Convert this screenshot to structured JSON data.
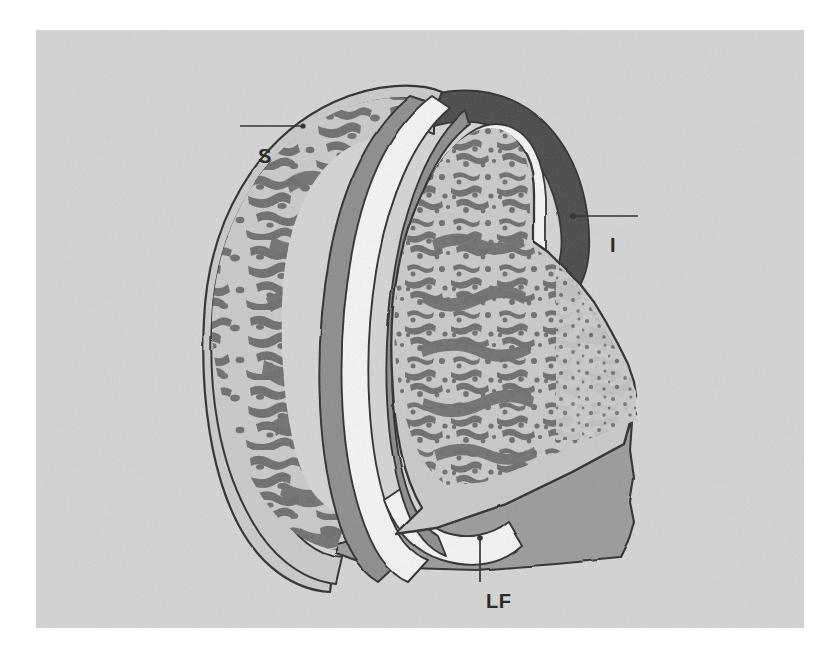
{
  "figure": {
    "kind": "anatomical-illustration",
    "view": "sagittal cut-away, cancellous bone shown in stipple",
    "background_color": "#d4d4d4",
    "page_color": "#ffffff"
  },
  "labels": {
    "superior": {
      "text": "S",
      "meaning": "superior articular process",
      "leader": "horizontal line pointing right to cortical margin"
    },
    "inferior": {
      "text": "I",
      "meaning": "inferior articular process",
      "leader": "horizontal line pointing left to bone margin"
    },
    "ligamentum_flavum": {
      "text": "LF",
      "meaning": "ligamentum flavum",
      "leader": "vertical line pointing up to lower contour"
    }
  },
  "palette": {
    "panel_background": "#d4d4d4",
    "cancellous_matrix": "#c9c9c9",
    "trabeculae": "#6d6d6d",
    "cortical_outline": "#2e2e2e",
    "articular_cartilage": "#8c8c8c",
    "joint_cavity": "#f4f4f2",
    "dark_capsule": "#4a4a4a",
    "ligamentum_flavum_fill": "#9a9a9a",
    "label_text": "#2b2b2b"
  },
  "structures": [
    {
      "name": "superior-articular-process",
      "fill": "#c9c9c9",
      "note": "crescent of cancellous bone on the left"
    },
    {
      "name": "articular-cartilage-superior",
      "fill": "#8c8c8c",
      "note": "grey band facing the joint"
    },
    {
      "name": "joint-cavity",
      "fill": "#f4f4f2",
      "note": "white cleft between cartilage surfaces"
    },
    {
      "name": "articular-cartilage-inferior",
      "fill": "#8c8c8c",
      "note": "grey band on the inferior process"
    },
    {
      "name": "inferior-articular-process",
      "fill": "#c9c9c9",
      "note": "larger block of cancellous bone on the right"
    },
    {
      "name": "joint-capsule",
      "fill": "#4a4a4a",
      "note": "dark cap over the superior pole of the joint"
    },
    {
      "name": "ligamentum-flavum",
      "fill": "#9a9a9a",
      "note": "mid-grey mass forming the floor of the field"
    }
  ]
}
